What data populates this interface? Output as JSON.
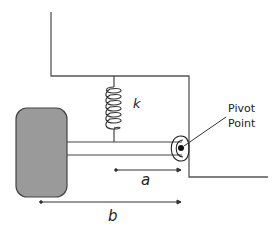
{
  "diagram": {
    "type": "mechanical schematic",
    "colors": {
      "line": "#555555",
      "mass_fill": "#9a9a9a",
      "mass_stroke": "#444444",
      "dot": "#111111",
      "text": "#222222"
    },
    "labels": {
      "spring_constant": "k",
      "pivot_line1": "Pivot",
      "pivot_line2": "Point",
      "distance_a": "a",
      "distance_b": "b"
    },
    "components": [
      {
        "name": "frame",
        "description": "fixed support frame"
      },
      {
        "name": "spring",
        "label": "k"
      },
      {
        "name": "mass",
        "description": "rounded rectangular mass (wheel)"
      },
      {
        "name": "rod",
        "description": "horizontal rigid rod connecting mass to pivot"
      },
      {
        "name": "pivot",
        "label": "Pivot Point"
      },
      {
        "name": "dimension-a",
        "label": "a",
        "from": "spring attachment",
        "to": "pivot"
      },
      {
        "name": "dimension-b",
        "label": "b",
        "from": "mass",
        "to": "pivot"
      }
    ]
  }
}
